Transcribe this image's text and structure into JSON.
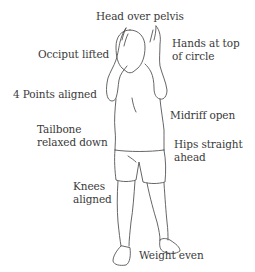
{
  "diagram": {
    "line_color": "#555555",
    "text_color": "#3a3a3a",
    "labels": [
      {
        "id": "head",
        "lines": [
          "Head over pelvis"
        ]
      },
      {
        "id": "hands",
        "lines": [
          "Hands at top",
          "of circle"
        ]
      },
      {
        "id": "occiput",
        "lines": [
          "Occiput lifted"
        ]
      },
      {
        "id": "points",
        "lines": [
          "4 Points aligned"
        ]
      },
      {
        "id": "midriff",
        "lines": [
          "Midriff open"
        ]
      },
      {
        "id": "tailbone",
        "lines": [
          "Tailbone",
          "relaxed down"
        ]
      },
      {
        "id": "hips",
        "lines": [
          "Hips straight",
          "ahead"
        ]
      },
      {
        "id": "knees",
        "lines": [
          "Knees",
          "aligned"
        ]
      },
      {
        "id": "weight",
        "lines": [
          "Weight even"
        ]
      }
    ]
  }
}
